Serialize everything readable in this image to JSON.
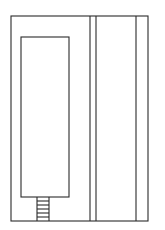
{
  "diagram": {
    "type": "floor-plan-sketch",
    "stroke_color": "#2a2a2a",
    "background": "#ffffff",
    "outer_frame": {
      "x": 11,
      "y": 16,
      "width": 137,
      "height": 205
    },
    "inner_room": {
      "x": 21,
      "y": 37,
      "width": 48,
      "height": 160
    },
    "vertical_lines_x": [
      90,
      96,
      136
    ],
    "stairs": {
      "x": 37,
      "width": 12,
      "top": 197,
      "bottom": 221,
      "rungs_y": [
        201,
        205,
        209,
        213,
        217
      ]
    }
  }
}
